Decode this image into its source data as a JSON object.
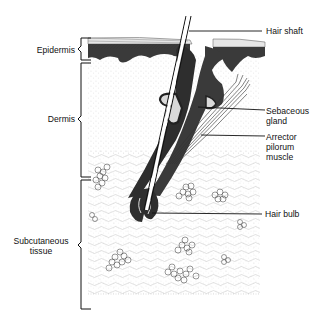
{
  "diagram": {
    "left_labels": [
      {
        "id": "epidermis",
        "text": "Epidermis"
      },
      {
        "id": "dermis",
        "text": "Dermis"
      },
      {
        "id": "subcutaneous",
        "line1": "Subcutaneous",
        "line2": "tissue"
      }
    ],
    "right_labels": [
      {
        "id": "hair-shaft",
        "text": "Hair shaft"
      },
      {
        "id": "sebaceous-gland",
        "line1": "Sebaceous",
        "line2": "gland"
      },
      {
        "id": "arrector",
        "line1": "Arrector",
        "line2": "pilorum",
        "line3": "muscle"
      },
      {
        "id": "hair-bulb",
        "text": "Hair bulb"
      }
    ],
    "colors": {
      "ink": "#111111",
      "paper": "#ffffff",
      "stipple": "#9a9a9a",
      "epidermis_dark": "#3a3a3a"
    }
  }
}
